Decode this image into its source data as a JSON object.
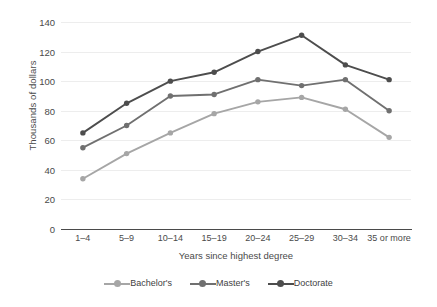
{
  "chart_data": {
    "type": "line",
    "title": "",
    "xlabel": "Years since highest degree",
    "ylabel": "Thousands of dollars",
    "categories": [
      "1–4",
      "5–9",
      "10–14",
      "15–19",
      "20–24",
      "25–29",
      "30–34",
      "35 or more"
    ],
    "series": [
      {
        "name": "Bachelor's",
        "color": "#a6a6a6",
        "values": [
          34,
          51,
          65,
          78,
          86,
          89,
          81,
          62
        ]
      },
      {
        "name": "Master's",
        "color": "#707070",
        "values": [
          55,
          70,
          90,
          91,
          101,
          97,
          101,
          80
        ]
      },
      {
        "name": "Doctorate",
        "color": "#4d4d4d",
        "values": [
          65,
          85,
          100,
          106,
          120,
          131,
          111,
          101
        ]
      }
    ],
    "ylim": [
      0,
      140
    ],
    "yticks": [
      0,
      20,
      40,
      60,
      80,
      100,
      120,
      140
    ],
    "ytick_labels": [
      "0",
      "20",
      "40",
      "60",
      "80",
      "100",
      "120",
      "140"
    ],
    "grid": true,
    "legend_position": "bottom"
  },
  "colors": {
    "background": "#ffffff",
    "gridline": "#ededed",
    "axis": "#4a4a4a",
    "text": "#4a4a4a"
  }
}
